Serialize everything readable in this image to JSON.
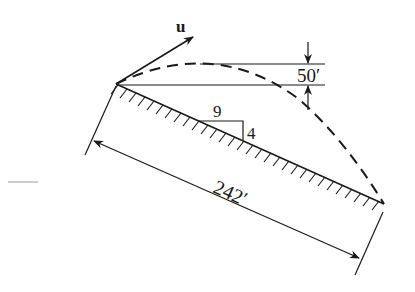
{
  "diagram": {
    "velocity_label": "u",
    "max_height_label": "50′",
    "slope_run_label": "9",
    "slope_rise_label": "4",
    "distance_label": "242′",
    "colors": {
      "ink": "#1a1a1a",
      "background": "#ffffff"
    }
  }
}
